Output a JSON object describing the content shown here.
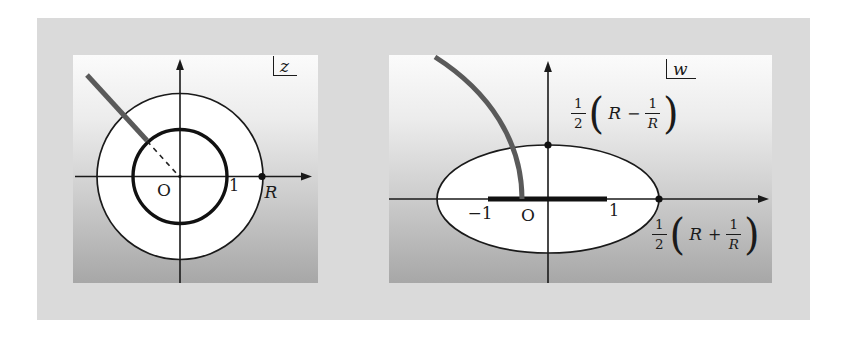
{
  "colors": {
    "frame_background": "#dadada",
    "panel_gradient_top": "#fbfbfb",
    "panel_gradient_bottom": "#a7a7a7",
    "region_fill": "#ffffff",
    "line_black": "#1a1a1a",
    "ray_gray": "#5a5a5a"
  },
  "z_panel": {
    "plane_label": "z",
    "origin_label": "O",
    "unit_label": "1",
    "radius_label": "R"
  },
  "w_panel": {
    "plane_label": "w",
    "neg_one_label": "−1",
    "origin_label": "O",
    "one_label": "1",
    "semi_minor_formula": {
      "half_num": "1",
      "half_den": "2",
      "open_paren": "(",
      "var": "R",
      "operator": "−",
      "inv_num": "1",
      "inv_den": "R",
      "close_paren": ")"
    },
    "semi_major_formula": {
      "half_num": "1",
      "half_den": "2",
      "open_paren": "(",
      "var": "R",
      "operator": "+",
      "inv_num": "1",
      "inv_den": "R",
      "close_paren": ")"
    }
  }
}
